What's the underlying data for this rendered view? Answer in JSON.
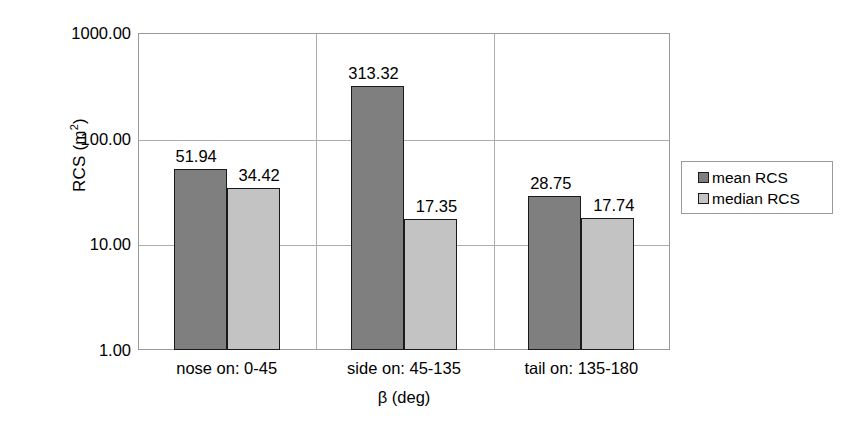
{
  "chart_data": {
    "type": "bar",
    "title": "",
    "xlabel": "β (deg)",
    "ylabel": "RCS (m²)",
    "ylabel_base": "RCS (m",
    "ylabel_sup": "2",
    "ylabel_close": ")",
    "yscale": "log",
    "ylim": [
      1,
      1000
    ],
    "ytick_labels": [
      "1000.00",
      "100.00",
      "10.00",
      "1.00"
    ],
    "ytick_values": [
      1000,
      100,
      10,
      1
    ],
    "grid": true,
    "legend_position": "right",
    "categories": [
      "nose on:  0-45",
      "side on: 45-135",
      "tail on: 135-180"
    ],
    "series": [
      {
        "name": "mean RCS",
        "color": "#7f7f7f",
        "values": [
          51.94,
          313.32,
          28.75
        ],
        "labels": [
          "51.94",
          "313.32",
          "28.75"
        ]
      },
      {
        "name": "median RCS",
        "color": "#c3c3c3",
        "values": [
          34.42,
          17.35,
          17.74
        ],
        "labels": [
          "34.42",
          "17.35",
          "17.74"
        ]
      }
    ]
  },
  "legend": {
    "entries": [
      {
        "label": "mean RCS",
        "swatch": "mean"
      },
      {
        "label": "median RCS",
        "swatch": "median"
      }
    ]
  },
  "colors": {
    "mean": "#7f7f7f",
    "median": "#c3c3c3",
    "grid": "#adadad",
    "frame": "#9a9a9a",
    "bar_outline": "#1a1a1a",
    "background": "#ffffff",
    "text": "#000000"
  }
}
